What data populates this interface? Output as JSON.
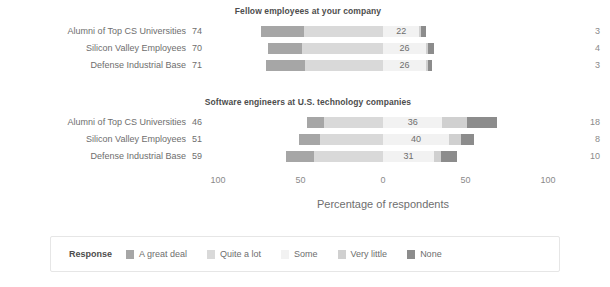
{
  "axis": {
    "title": "Percentage of respondents",
    "ticks": [
      {
        "label": "100",
        "value": -100
      },
      {
        "label": "50",
        "value": -50
      },
      {
        "label": "0",
        "value": 0
      },
      {
        "label": "50",
        "value": 50
      },
      {
        "label": "100",
        "value": 100
      }
    ]
  },
  "legend": {
    "title": "Response",
    "items": [
      {
        "label": "A great deal",
        "color": "#a6a6a6"
      },
      {
        "label": "Quite a lot",
        "color": "#d9d9d9"
      },
      {
        "label": "Some",
        "color": "#f2f2f2"
      },
      {
        "label": "Very little",
        "color": "#d0d0d0"
      },
      {
        "label": "None",
        "color": "#8c8c8c"
      }
    ]
  },
  "colors": {
    "a_great_deal": "#a6a6a6",
    "quite_a_lot": "#d9d9d9",
    "some": "#f2f2f2",
    "very_little": "#d0d0d0",
    "none": "#8c8c8c",
    "text": "#6e6e6e",
    "title": "#4d4d4d",
    "legend_border": "#e6e6e6"
  },
  "chart_data": {
    "type": "bar",
    "subtype": "diverging-stacked-likert",
    "title": "",
    "xlabel": "Percentage of respondents",
    "ylabel": "",
    "xlim": [
      -100,
      100
    ],
    "grid": false,
    "legend_position": "bottom",
    "categories": [
      "A great deal",
      "Quite a lot",
      "Some",
      "Very little",
      "None"
    ],
    "groups": [
      "Alumni of Top CS Universities",
      "Silicon Valley Employees",
      "Defense Industrial Base"
    ],
    "panels": [
      {
        "title": "Fellow employees at your company",
        "rows": [
          {
            "group": "Alumni of Top CS Universities",
            "left_total": 74,
            "right_total": 3,
            "center_label": "22",
            "values": {
              "a_great_deal": 26,
              "quite_a_lot": 48,
              "some": 22,
              "very_little": 1,
              "none": 3
            }
          },
          {
            "group": "Silicon Valley Employees",
            "left_total": 70,
            "right_total": 4,
            "center_label": "26",
            "values": {
              "a_great_deal": 21,
              "quite_a_lot": 49,
              "some": 26,
              "very_little": 1,
              "none": 4
            }
          },
          {
            "group": "Defense Industrial Base",
            "left_total": 71,
            "right_total": 3,
            "center_label": "26",
            "values": {
              "a_great_deal": 24,
              "quite_a_lot": 47,
              "some": 26,
              "very_little": 1,
              "none": 3
            }
          }
        ]
      },
      {
        "title": "Software engineers at U.S. technology companies",
        "rows": [
          {
            "group": "Alumni of Top CS Universities",
            "left_total": 46,
            "right_total": 18,
            "center_label": "36",
            "values": {
              "a_great_deal": 10,
              "quite_a_lot": 36,
              "some": 36,
              "very_little": 15,
              "none": 18
            }
          },
          {
            "group": "Silicon Valley Employees",
            "left_total": 51,
            "right_total": 8,
            "center_label": "40",
            "values": {
              "a_great_deal": 13,
              "quite_a_lot": 38,
              "some": 40,
              "very_little": 7,
              "none": 8
            }
          },
          {
            "group": "Defense Industrial Base",
            "left_total": 59,
            "right_total": 10,
            "center_label": "31",
            "values": {
              "a_great_deal": 17,
              "quite_a_lot": 42,
              "some": 31,
              "very_little": 4,
              "none": 10
            }
          }
        ]
      }
    ]
  }
}
